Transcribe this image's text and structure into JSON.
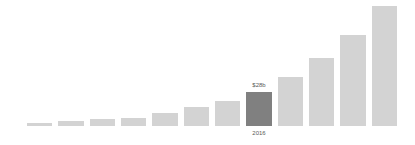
{
  "chart_data": {
    "type": "bar",
    "title": "",
    "subtitle": "",
    "xlabel": "",
    "ylabel": "",
    "grid": false,
    "legend": false,
    "axes_visible": false,
    "background_color": "#ffffff",
    "bar_color": "#d3d3d3",
    "highlight_color": "#808080",
    "label_color": "#5a5a5a",
    "ylim": [
      0,
      100
    ],
    "categories": [
      "",
      "",
      "",
      "",
      "",
      "",
      "",
      "2016",
      "",
      "",
      "",
      ""
    ],
    "values": [
      2.5,
      4,
      5.5,
      7,
      11,
      16,
      21,
      28,
      41,
      57,
      76,
      100
    ],
    "highlight_index": 7,
    "annotations": [
      {
        "index": 7,
        "value_label": "$28b",
        "category_label": "2016"
      }
    ]
  }
}
